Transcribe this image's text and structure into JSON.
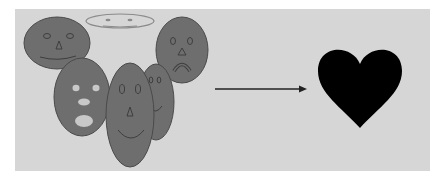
{
  "diagram": {
    "colors": {
      "background": "#ffffff",
      "panel": "#d6d6d6",
      "face_fill": "#6e6e6e",
      "face_stroke": "#4a4a4a",
      "feature_light": "#c8c8c8",
      "arrow": "#222222",
      "heart": "#000000"
    },
    "faces": [
      {
        "name": "smiling-face-top-left",
        "expression": "smile"
      },
      {
        "name": "faint-flat-face-top",
        "expression": "faint"
      },
      {
        "name": "frowning-face-top-right",
        "expression": "frown"
      },
      {
        "name": "surprised-face",
        "expression": "surprised"
      },
      {
        "name": "tall-smiling-face",
        "expression": "smile"
      },
      {
        "name": "partially-hidden-face",
        "expression": "smile"
      }
    ],
    "arrow": {
      "direction": "right"
    },
    "heart": {
      "shape": "heart"
    }
  }
}
